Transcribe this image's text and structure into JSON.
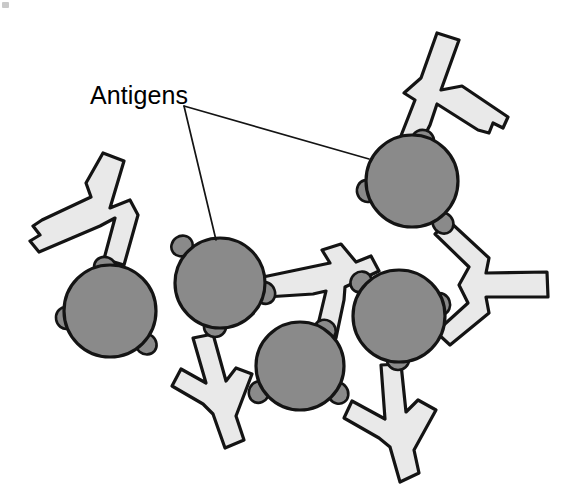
{
  "figure": {
    "title": "Antigens",
    "kind": "antigen-antibody-complex-diagram",
    "canvas": {
      "width": 574,
      "height": 494,
      "background": "#ffffff"
    },
    "colors": {
      "antigen_fill": "#8a8a8a",
      "antibody_fill": "#e9e9e9",
      "outline": "#141414",
      "label_text": "#000000",
      "leader_line": "#141414"
    }
  },
  "labels": [
    {
      "id": "antigens-label",
      "text": "Antigens",
      "x": 90,
      "y": 104,
      "font_size": 25
    }
  ],
  "leader_lines": [
    {
      "id": "leader-to-upper-right-antigen",
      "from_x": 184,
      "from_y": 106,
      "to_x": 369,
      "to_y": 159,
      "points": "184,106 369,159"
    },
    {
      "id": "leader-to-center-antigen",
      "from_x": 184,
      "from_y": 106,
      "to_x": 216,
      "to_y": 240,
      "points": "184,106 216,240"
    }
  ],
  "antigens": [
    {
      "id": "antigen-left",
      "cx": 110,
      "cy": 311,
      "r": 46,
      "label": "Antigen"
    },
    {
      "id": "antigen-center",
      "cx": 220,
      "cy": 283,
      "r": 45,
      "label": "Antigen"
    },
    {
      "id": "antigen-bottom-mid",
      "cx": 300,
      "cy": 366,
      "r": 44,
      "label": "Antigen"
    },
    {
      "id": "antigen-right-mid",
      "cx": 399,
      "cy": 316,
      "r": 46,
      "label": "Antigen"
    },
    {
      "id": "antigen-upper-right",
      "cx": 412,
      "cy": 181,
      "r": 46,
      "label": "Antigen"
    }
  ],
  "epitopes": [
    {
      "id": "epitope-left-w",
      "antigen": "antigen-left",
      "cx": 66,
      "cy": 318,
      "rx": 10,
      "ry": 11,
      "rot": -10
    },
    {
      "id": "epitope-left-ne",
      "antigen": "antigen-left",
      "cx": 105,
      "cy": 267,
      "rx": 11,
      "ry": 10,
      "rot": 20
    },
    {
      "id": "epitope-left-se",
      "antigen": "antigen-left",
      "cx": 146,
      "cy": 344,
      "rx": 11,
      "ry": 10,
      "rot": 40
    },
    {
      "id": "epitope-cen-nw",
      "antigen": "antigen-center",
      "cx": 182,
      "cy": 246,
      "rx": 11,
      "ry": 10,
      "rot": -35
    },
    {
      "id": "epitope-cen-e",
      "antigen": "antigen-center",
      "cx": 265,
      "cy": 293,
      "rx": 11,
      "ry": 10,
      "rot": 70
    },
    {
      "id": "epitope-cen-s",
      "antigen": "antigen-center",
      "cx": 215,
      "cy": 327,
      "rx": 11,
      "ry": 10,
      "rot": 0
    },
    {
      "id": "epitope-bm-w",
      "antigen": "antigen-bottom-mid",
      "cx": 259,
      "cy": 392,
      "rx": 10,
      "ry": 11,
      "rot": 25
    },
    {
      "id": "epitope-bm-ne",
      "antigen": "antigen-bottom-mid",
      "cx": 325,
      "cy": 330,
      "rx": 11,
      "ry": 10,
      "rot": 30
    },
    {
      "id": "epitope-bm-se",
      "antigen": "antigen-bottom-mid",
      "cx": 338,
      "cy": 393,
      "rx": 11,
      "ry": 10,
      "rot": 55
    },
    {
      "id": "epitope-rm-nw",
      "antigen": "antigen-right-mid",
      "cx": 361,
      "cy": 282,
      "rx": 11,
      "ry": 10,
      "rot": -40
    },
    {
      "id": "epitope-rm-ne",
      "antigen": "antigen-right-mid",
      "cx": 440,
      "cy": 304,
      "rx": 11,
      "ry": 10,
      "rot": 70
    },
    {
      "id": "epitope-rm-s",
      "antigen": "antigen-right-mid",
      "cx": 398,
      "cy": 360,
      "rx": 11,
      "ry": 10,
      "rot": 0
    },
    {
      "id": "epitope-ur-n",
      "antigen": "antigen-upper-right",
      "cx": 423,
      "cy": 140,
      "rx": 11,
      "ry": 10,
      "rot": 15
    },
    {
      "id": "epitope-ur-w",
      "antigen": "antigen-upper-right",
      "cx": 367,
      "cy": 191,
      "rx": 10,
      "ry": 11,
      "rot": -15
    },
    {
      "id": "epitope-ur-se",
      "antigen": "antigen-upper-right",
      "cx": 443,
      "cy": 223,
      "rx": 11,
      "ry": 10,
      "rot": 50
    }
  ],
  "antibodies": [
    {
      "id": "antibody-upper-right-free",
      "description": "Y antibody at top right; stem bound to upper-right antigen, one arm free with notched tip",
      "path": "M 437 33 L 459 40 L 441 90 L 462 86 L 508 117 L 503 128 L 493 123 L 489 133 L 478 130 L 437 104 L 430 125 L 413 158 L 395 151 L 415 100 L 404 93 L 421 78 Z"
    },
    {
      "id": "antibody-left-free",
      "description": "Y antibody at upper left; stem bound to left antigen, one arm free with notched tip",
      "path": "M 103 153 L 124 161 L 110 208 L 130 200 L 138 215 L 124 265 L 104 259 L 115 218 L 100 226 L 39 252 L 30 241 L 40 235 L 33 226 L 42 220 L 91 197 L 86 183 Z"
    },
    {
      "id": "antibody-center-bridge",
      "description": "Y antibody linking center antigen to bottom-mid antigen, stem free pointing down",
      "path": "M 193 338 L 213 334 L 226 381 L 236 368 L 252 374 L 236 416 L 244 440 L 225 448 L 213 414 L 203 404 L 172 386 L 181 369 L 206 383 Z"
    },
    {
      "id": "antibody-mid-right-bridge",
      "description": "Y antibody linking center antigen and bottom-mid antigen, stem pointing up-right",
      "path": "M 263 277 L 330 263 L 322 250 L 341 244 L 356 262 L 371 256 L 379 271 L 345 287 L 344 300 L 336 338 L 316 333 L 326 291 L 313 294 L 266 297 Z"
    },
    {
      "id": "antibody-right-bridge",
      "description": "Y antibody linking upper-right antigen and right-mid antigen, stem pointing right",
      "path": "M 449 221 L 489 258 L 486 273 L 547 272 L 548 297 L 486 297 L 489 313 L 450 345 L 436 332 L 468 303 L 459 285 L 469 267 L 435 234 Z"
    },
    {
      "id": "antibody-bottom-right-free",
      "description": "Y antibody bound to right-mid and bottom-mid antigens, free stem pointing down-right",
      "path": "M 381 365 L 401 364 L 406 412 L 418 400 L 436 410 L 414 450 L 419 473 L 400 482 L 390 447 L 379 438 L 344 418 L 352 401 L 385 419 Z"
    }
  ]
}
